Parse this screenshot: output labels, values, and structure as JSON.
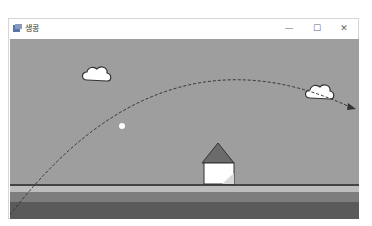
{
  "window": {
    "title": "생콩",
    "controls": {
      "minimize": "—",
      "maximize": "☐",
      "close": "✕"
    }
  },
  "scene": {
    "sky_color": "#9e9e9e",
    "ground": {
      "line_color": "#444444",
      "strip_light": "#bdbdbd",
      "strip_mid": "#7d7d7d",
      "strip_dark": "#5a5a5a"
    },
    "clouds": [
      {
        "name": "cloud-left",
        "x": 80,
        "y": 65
      },
      {
        "name": "cloud-right",
        "x": 316,
        "y": 83
      }
    ],
    "house": {
      "x": 218,
      "roof_color": "#6b6b6b",
      "wall_color": "#ffffff"
    },
    "ball": {
      "x": 121,
      "y": 125,
      "color": "#ffffff"
    },
    "trajectory": {
      "style": "dashed",
      "arrow": true
    }
  }
}
